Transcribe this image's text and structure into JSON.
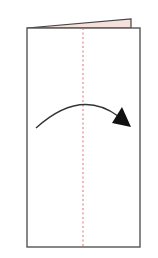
{
  "diagram": {
    "type": "origami-fold-step",
    "paper": {
      "x": 27,
      "y": 28,
      "width": 113,
      "height": 219,
      "stroke": "#555555",
      "fill": "#ffffff"
    },
    "flap": {
      "color": "#f6e0dc",
      "stroke": "#444444",
      "points": "27,28 131,19 131,28"
    },
    "fold_line": {
      "x": 83,
      "style": "dashed",
      "color": "#e06060"
    },
    "arrow": {
      "direction": "left-to-right",
      "color": "#222222",
      "start": [
        36,
        128
      ],
      "control": [
        83,
        86
      ],
      "end": [
        118,
        118
      ],
      "tip": [
        131,
        127
      ]
    }
  }
}
